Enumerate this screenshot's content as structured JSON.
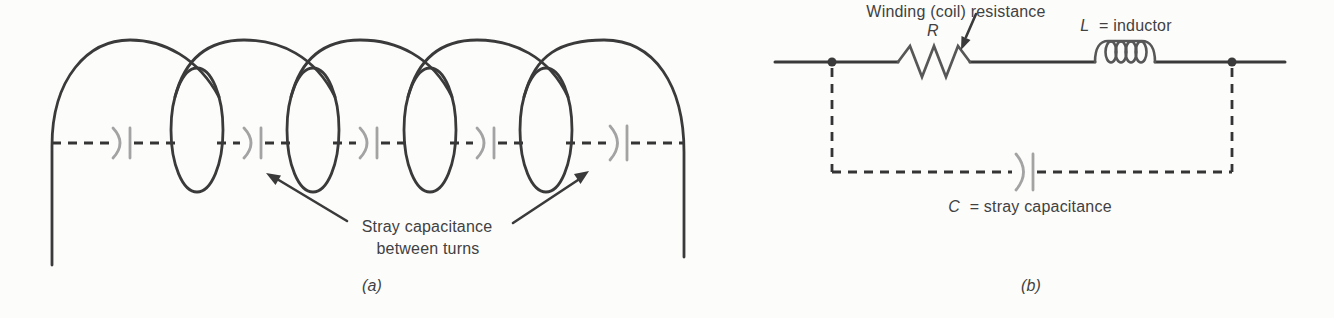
{
  "figure": {
    "panel_a": {
      "caption": "(a)",
      "annotation": {
        "line1": "Stray capacitance",
        "line2": "between turns"
      }
    },
    "panel_b": {
      "caption": "(b)",
      "resistance_label": "Winding (coil) resistance",
      "resistance_symbol": "R",
      "inductor_symbol": "L",
      "inductor_label": "= inductor",
      "capacitance_symbol": "C",
      "capacitance_label": "= stray capacitance"
    },
    "colors": {
      "line": "#3a3a3a",
      "component": "#575757",
      "stray_capacitor": "#a3a3a3",
      "text": "#414141",
      "background": "#fcfcfb"
    }
  }
}
